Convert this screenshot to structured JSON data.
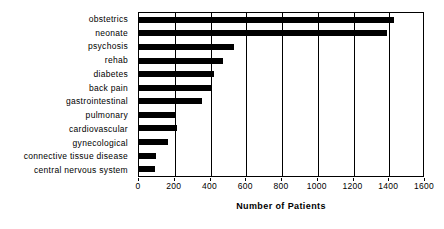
{
  "chart_data": {
    "type": "bar",
    "orientation": "horizontal",
    "title": "",
    "xlabel": "Number of Patients",
    "ylabel": "",
    "xlim": [
      0,
      1600
    ],
    "ylim": null,
    "grid": true,
    "legend": null,
    "bar_color": "#000000",
    "background_color": "#ffffff",
    "axis_color": "#000000",
    "xticks": [
      0,
      200,
      400,
      600,
      800,
      1000,
      1200,
      1400,
      1600
    ],
    "xticklabels": [
      "0",
      "200",
      "400",
      "600",
      "800",
      "1000",
      "1200",
      "1400",
      "1600"
    ],
    "categories": [
      "obstetrics",
      "neonate",
      "psychosis",
      "rehab",
      "diabetes",
      "back pain",
      "gastrointestinal",
      "pulmonary",
      "cardiovascular",
      "gynecological",
      "connective tissue disease",
      "central nervous system"
    ],
    "values": [
      1425,
      1385,
      530,
      470,
      420,
      410,
      355,
      205,
      215,
      165,
      95,
      90
    ]
  }
}
